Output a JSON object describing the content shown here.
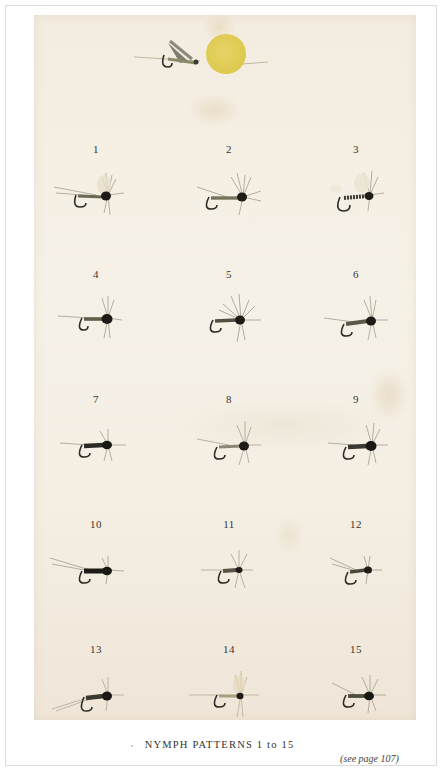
{
  "plate": {
    "caption": "NYMPH PATTERNS 1 to 15",
    "page_reference": "(see page 107)",
    "frontispiece": {
      "description": "single fly beside a yellow disc",
      "disc_color": "#ddc94e"
    },
    "background_color": "#f4eee3",
    "flies": [
      {
        "number": "1",
        "row": 0,
        "col": 0
      },
      {
        "number": "2",
        "row": 0,
        "col": 1
      },
      {
        "number": "3",
        "row": 0,
        "col": 2
      },
      {
        "number": "4",
        "row": 1,
        "col": 0
      },
      {
        "number": "5",
        "row": 1,
        "col": 1
      },
      {
        "number": "6",
        "row": 1,
        "col": 2
      },
      {
        "number": "7",
        "row": 2,
        "col": 0
      },
      {
        "number": "8",
        "row": 2,
        "col": 1
      },
      {
        "number": "9",
        "row": 2,
        "col": 2
      },
      {
        "number": "10",
        "row": 3,
        "col": 0
      },
      {
        "number": "11",
        "row": 3,
        "col": 1
      },
      {
        "number": "12",
        "row": 3,
        "col": 2
      },
      {
        "number": "13",
        "row": 4,
        "col": 0
      },
      {
        "number": "14",
        "row": 4,
        "col": 1
      },
      {
        "number": "15",
        "row": 4,
        "col": 2
      }
    ]
  }
}
